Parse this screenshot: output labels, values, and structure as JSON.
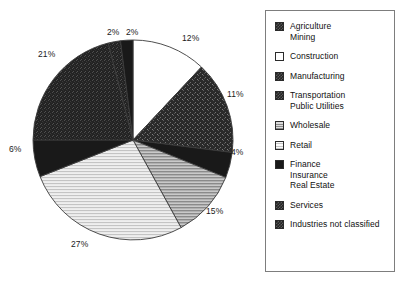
{
  "chart_data": {
    "type": "pie",
    "title": "",
    "legend_position": "right",
    "labels_shown": true,
    "unit": "%",
    "categories": [
      "Construction",
      "Transportation Public Utilities",
      "Wholesale",
      "Retail",
      "Finance Insurance Real Estate",
      "Services",
      "Industries not classified",
      "Agriculture Mining",
      "Manufacturing"
    ],
    "values": [
      12,
      11,
      4,
      15,
      27,
      6,
      21,
      2,
      2
    ],
    "slices": [
      {
        "label": "12%",
        "value": 12,
        "category": "Construction",
        "pattern": "white",
        "label_x": 182,
        "label_y": 34
      },
      {
        "label": "11%",
        "value": 11,
        "category": "Transportation Public Utilities",
        "pattern": "speckle-dark",
        "label_x": 227,
        "label_y": 90
      },
      {
        "label": "4%",
        "value": 4,
        "category": "Wholesale",
        "pattern": "solid-black",
        "label_x": 231,
        "label_y": 148
      },
      {
        "label": "15%",
        "value": 15,
        "category": "Retail",
        "pattern": "hatch-medium",
        "label_x": 206,
        "label_y": 207
      },
      {
        "label": "27%",
        "value": 27,
        "category": "Finance Insurance Real Estate",
        "pattern": "hatch-light",
        "label_x": 71,
        "label_y": 240
      },
      {
        "label": "6%",
        "value": 6,
        "category": "Services",
        "pattern": "solid-black",
        "label_x": 9,
        "label_y": 145
      },
      {
        "label": "21%",
        "value": 21,
        "category": "Industries not classified",
        "pattern": "noise-dark",
        "label_x": 38,
        "label_y": 50
      },
      {
        "label": "2%",
        "value": 2,
        "category": "Agriculture Mining",
        "pattern": "noise-dark",
        "label_x": 107,
        "label_y": 28
      },
      {
        "label": "2%",
        "value": 2,
        "category": "Manufacturing",
        "pattern": "solid-black",
        "label_x": 126,
        "label_y": 28
      }
    ]
  },
  "legend": {
    "items": [
      {
        "swatch": "checker-dark",
        "lines": [
          "Agriculture",
          "Mining"
        ]
      },
      {
        "swatch": "white",
        "lines": [
          "Construction"
        ]
      },
      {
        "swatch": "checker-dark",
        "lines": [
          "Manufacturing"
        ]
      },
      {
        "swatch": "checker-dark",
        "lines": [
          "Transportation",
          "Public Utilities"
        ]
      },
      {
        "swatch": "hatch-medium",
        "lines": [
          "Wholesale"
        ]
      },
      {
        "swatch": "hatch-light",
        "lines": [
          "Retail"
        ]
      },
      {
        "swatch": "solid-black",
        "lines": [
          "Finance",
          "Insurance",
          "Real Estate"
        ]
      },
      {
        "swatch": "checker-dark",
        "lines": [
          "Services"
        ]
      },
      {
        "swatch": "checker-dark",
        "lines": [
          "Industries not classified"
        ]
      }
    ]
  },
  "colors": {
    "ink": "#111111",
    "border": "#7d7d7d",
    "background": "#ffffff",
    "black": "#1b1b1b",
    "dark": "#2e2e2e",
    "medium_gray": "#9a9a9a",
    "light_gray": "#d2d2d2",
    "white": "#ffffff"
  }
}
